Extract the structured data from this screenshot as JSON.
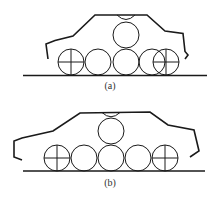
{
  "figures": [
    {
      "id": "a",
      "caption": "(a)",
      "description": "Car outline over ground line with five rolling circles in a row and one circle stacked on top of the middle circle; end circles marked with crosshairs, right crosshair circle overlapping its neighbour"
    },
    {
      "id": "b",
      "caption": "(b)",
      "description": "Longer car outline over ground line with five rolling circles in a row and one circle stacked on top of the middle circle; both end circles marked with crosshairs"
    }
  ],
  "colors": {
    "stroke": "#1a1a1a",
    "background": "#ffffff"
  }
}
